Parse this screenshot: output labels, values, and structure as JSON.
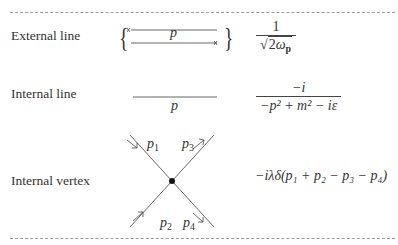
{
  "rules": [
    {
      "label": "External line",
      "diagram": {
        "momentum_label": "p",
        "brace_open": "{",
        "brace_close": "}",
        "marker": "×"
      },
      "expression": {
        "numerator": "1",
        "denominator_sqrt": "2ω",
        "denominator_sub": "p"
      }
    },
    {
      "label": "Internal line",
      "diagram": {
        "momentum_label": "p"
      },
      "expression": {
        "numerator": "−i",
        "denominator": "−p² + m² − iε"
      }
    },
    {
      "label": "Internal vertex",
      "diagram": {
        "p1": "p",
        "p1_sub": "1",
        "p2": "p",
        "p2_sub": "2",
        "p3": "p",
        "p3_sub": "3",
        "p4": "p",
        "p4_sub": "4"
      },
      "expression": {
        "text": "−iλδ(p₁ + p₂ − p₃ − p₄)"
      }
    }
  ],
  "colors": {
    "line": "#666666",
    "text": "#333333",
    "rule": "#9a9a9a"
  }
}
